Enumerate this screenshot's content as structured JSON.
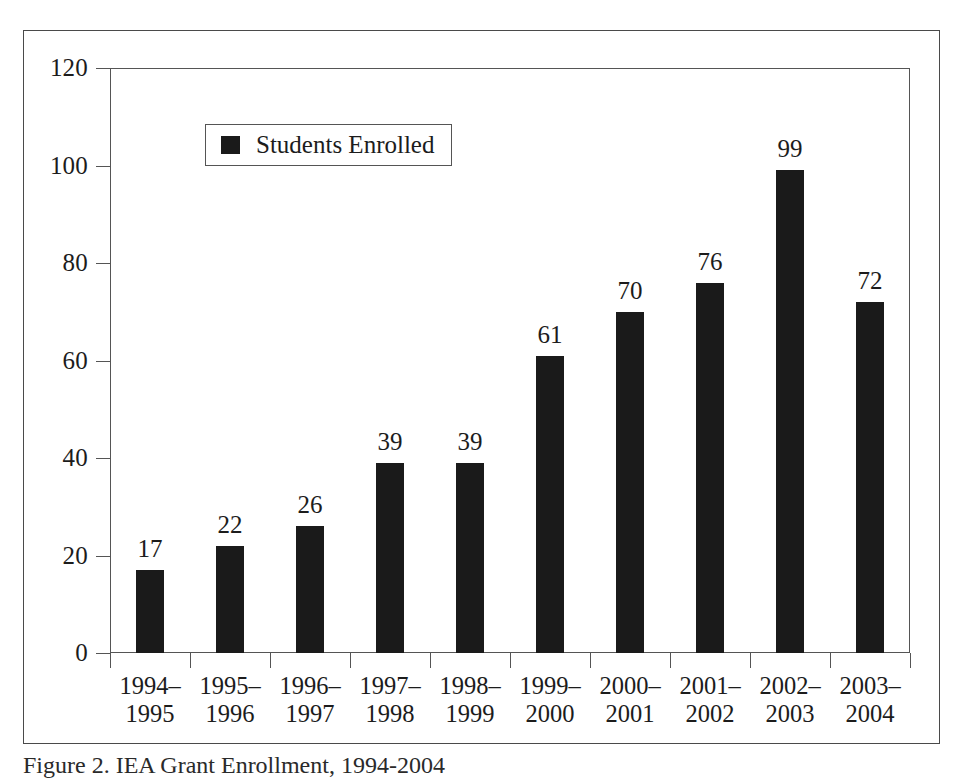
{
  "figure": {
    "caption": "Figure 2. IEA Grant Enrollment, 1994-2004"
  },
  "legend": {
    "entries": [
      {
        "label": "Students Enrolled",
        "color": "#1a1a1a",
        "swatch": "filled-square-swatch"
      }
    ],
    "position": "inside-upper-left"
  },
  "colors": {
    "bar": "#1a1a1a",
    "axis": "#555555",
    "frame": "#4a4a4a",
    "text": "#1c1c1c",
    "background": "#ffffff"
  },
  "axes": {
    "y_ticks": [
      "0",
      "20",
      "40",
      "60",
      "80",
      "100",
      "120"
    ],
    "y_min": 0,
    "y_max": 120,
    "y_step": 20,
    "grid": false
  },
  "chart_data": {
    "type": "bar",
    "title": "",
    "xlabel": "",
    "ylabel": "",
    "ylim": [
      0,
      120
    ],
    "ytick_step": 20,
    "grid": false,
    "legend_position": "inside-upper-left",
    "orientation": "vertical",
    "categories": [
      "1994-1995",
      "1995-1996",
      "1996-1997",
      "1997-1998",
      "1998-1999",
      "1999-2000",
      "2000-2001",
      "2001-2002",
      "2002-2003",
      "2003-2004"
    ],
    "category_lines": [
      [
        "1994–",
        "1995"
      ],
      [
        "1995–",
        "1996"
      ],
      [
        "1996–",
        "1997"
      ],
      [
        "1997–",
        "1998"
      ],
      [
        "1998–",
        "1999"
      ],
      [
        "1999–",
        "2000"
      ],
      [
        "2000–",
        "2001"
      ],
      [
        "2001–",
        "2002"
      ],
      [
        "2002–",
        "2003"
      ],
      [
        "2003–",
        "2004"
      ]
    ],
    "series": [
      {
        "name": "Students Enrolled",
        "color": "#1a1a1a",
        "values": [
          17,
          22,
          26,
          39,
          39,
          61,
          70,
          76,
          99,
          72
        ]
      }
    ],
    "value_labels": [
      "17",
      "22",
      "26",
      "39",
      "39",
      "61",
      "70",
      "76",
      "99",
      "72"
    ]
  }
}
